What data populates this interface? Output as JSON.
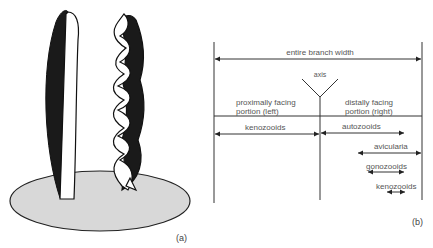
{
  "panel_a": {
    "label": "(a)",
    "description": "Two erect bryozoan branches on a grey base: a flat blade and a spirally twisted branch, each with dark and white faces"
  },
  "panel_b": {
    "label": "(b)",
    "entire_width": "entire branch width",
    "axis": "axis",
    "left_portion": [
      "proximally facing",
      "portion (left)"
    ],
    "right_portion": [
      "distally facing",
      "portion (right)"
    ],
    "zones": [
      {
        "name": "kenozooids",
        "side": "left"
      },
      {
        "name": "autozooids",
        "side": "right"
      },
      {
        "name": "avicularia",
        "side": "right"
      },
      {
        "name": "gonozooids",
        "side": "right"
      },
      {
        "name": "kenozooids",
        "side": "right"
      }
    ]
  },
  "colors": {
    "line": "#333333",
    "dark_face": "#1a1a1a",
    "base": "#d8d8d8"
  }
}
